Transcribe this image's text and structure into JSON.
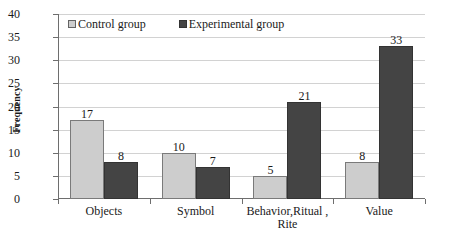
{
  "chart_data": {
    "type": "bar",
    "title": "",
    "xlabel": "",
    "ylabel": "Frequency",
    "ylim": [
      0,
      40
    ],
    "ytick_step": 5,
    "yticks": [
      40,
      35,
      30,
      25,
      20,
      15,
      10,
      5,
      0
    ],
    "grid": true,
    "legend_position": "top-left-inside",
    "categories": [
      "Objects",
      "Symbol",
      "Behavior,Ritual ,\nRite",
      "Value"
    ],
    "series": [
      {
        "name": "Control group",
        "color": "#cdcdcd",
        "values": [
          17,
          10,
          5,
          8
        ],
        "value_labels": [
          "17",
          "10",
          "5",
          "8"
        ]
      },
      {
        "name": "Experimental group",
        "color": "#444444",
        "values": [
          8,
          7,
          21,
          33
        ],
        "value_labels": [
          "8",
          "7",
          "21",
          "33"
        ]
      }
    ]
  },
  "legend": {
    "items": [
      {
        "label": "Control group"
      },
      {
        "label": "Experimental group"
      }
    ]
  },
  "axis": {
    "y_title": "Frequency"
  },
  "colors": {
    "control": "#cdcdcd",
    "experimental": "#444444",
    "axis": "#6e6e6e",
    "gridline": "#d2d2d2",
    "background": "#ffffff",
    "text": "#1a1a1a"
  }
}
